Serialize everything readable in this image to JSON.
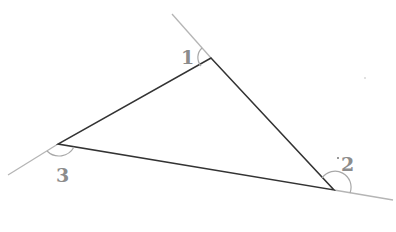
{
  "diagram": {
    "type": "triangle-exterior-angles",
    "colors": {
      "triangle_stroke": "#333333",
      "extension_stroke": "#b5b5b5",
      "arc_stroke": "#a8a8a8",
      "label": "#8c8c8c",
      "background": "#ffffff"
    },
    "vertices": [
      {
        "id": "A",
        "x": 211,
        "y": 58
      },
      {
        "id": "B",
        "x": 334,
        "y": 190
      },
      {
        "id": "C",
        "x": 58,
        "y": 144
      }
    ],
    "angles": [
      {
        "label": "1",
        "vertex": "A",
        "label_x": 184,
        "label_y": 64
      },
      {
        "label": "2",
        "vertex": "B",
        "label_x": 342,
        "label_y": 170
      },
      {
        "label": "3",
        "vertex": "C",
        "label_x": 57,
        "label_y": 181
      }
    ]
  }
}
